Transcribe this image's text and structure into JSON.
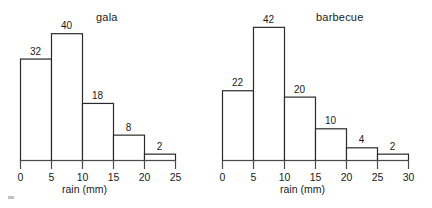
{
  "chart_data": [
    {
      "type": "bar",
      "title": "gala",
      "xlabel": "rain (mm)",
      "ylabel": "",
      "grid": false,
      "legend": "none",
      "bin_width": 5,
      "categories": [
        "0-5",
        "5-10",
        "10-15",
        "15-20",
        "20-25"
      ],
      "bin_edges": [
        0,
        5,
        10,
        15,
        20,
        25
      ],
      "values": [
        32,
        40,
        18,
        8,
        2
      ],
      "xticks": [
        0,
        5,
        10,
        15,
        20,
        25
      ],
      "xlim": [
        0,
        25
      ],
      "ylim": [
        0,
        42
      ]
    },
    {
      "type": "bar",
      "title": "barbecue",
      "xlabel": "rain (mm)",
      "ylabel": "",
      "grid": false,
      "legend": "none",
      "bin_width": 5,
      "categories": [
        "0-5",
        "5-10",
        "10-15",
        "15-20",
        "20-25",
        "25-30"
      ],
      "bin_edges": [
        0,
        5,
        10,
        15,
        20,
        25,
        30
      ],
      "values": [
        22,
        42,
        20,
        10,
        4,
        2
      ],
      "xticks": [
        0,
        5,
        10,
        15,
        20,
        25,
        30
      ],
      "xlim": [
        0,
        30
      ],
      "ylim": [
        0,
        42
      ]
    }
  ],
  "style": {
    "bar_stroke": "#2a2a2a",
    "bar_fill": "#ffffff",
    "axis_color": "#4a4a4a",
    "text_color": "#1a1a1a"
  }
}
